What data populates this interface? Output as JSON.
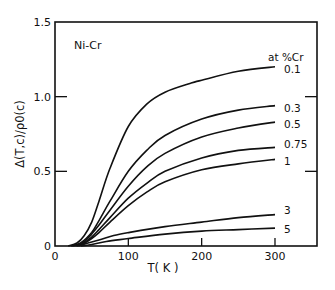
{
  "chart_data": {
    "type": "line",
    "title": "",
    "annotation": "Ni-Cr",
    "legend_title": "at %Cr",
    "xlabel": "T( K )",
    "ylabel": "Δ(T,c)/ρ0(c)",
    "xlim": [
      0,
      360
    ],
    "ylim": [
      0,
      1.5
    ],
    "xticks": [
      0,
      100,
      200,
      300
    ],
    "xtick_labels": [
      "0",
      "100",
      "200",
      "300"
    ],
    "yticks": [
      0,
      0.5,
      1.0,
      1.5
    ],
    "ytick_labels": [
      "0",
      "0.5",
      "1.0",
      "1.5"
    ],
    "grid": false,
    "legend_position": "inline labels at right end of curves",
    "series": [
      {
        "name": "0.1",
        "x": [
          18,
          30,
          40,
          50,
          60,
          75,
          100,
          125,
          150,
          185,
          200,
          250,
          300
        ],
        "y": [
          0,
          0.02,
          0.07,
          0.16,
          0.3,
          0.52,
          0.8,
          0.95,
          1.03,
          1.09,
          1.11,
          1.17,
          1.2
        ]
      },
      {
        "name": "0.3",
        "x": [
          22,
          35,
          50,
          60,
          75,
          100,
          125,
          150,
          200,
          250,
          300
        ],
        "y": [
          0,
          0.02,
          0.09,
          0.17,
          0.3,
          0.5,
          0.64,
          0.74,
          0.85,
          0.91,
          0.94
        ]
      },
      {
        "name": "0.5",
        "x": [
          25,
          40,
          50,
          60,
          75,
          100,
          125,
          150,
          200,
          250,
          300
        ],
        "y": [
          0,
          0.03,
          0.08,
          0.14,
          0.24,
          0.4,
          0.53,
          0.62,
          0.73,
          0.79,
          0.83
        ]
      },
      {
        "name": "0.75",
        "x": [
          28,
          40,
          50,
          60,
          75,
          100,
          125,
          150,
          200,
          250,
          300
        ],
        "y": [
          0,
          0.02,
          0.06,
          0.11,
          0.19,
          0.32,
          0.42,
          0.5,
          0.59,
          0.64,
          0.66
        ]
      },
      {
        "name": "1",
        "x": [
          30,
          40,
          50,
          60,
          75,
          100,
          125,
          150,
          200,
          250,
          300
        ],
        "y": [
          0,
          0.02,
          0.05,
          0.09,
          0.16,
          0.27,
          0.36,
          0.43,
          0.51,
          0.55,
          0.58
        ]
      },
      {
        "name": "3",
        "x": [
          32,
          45,
          60,
          80,
          100,
          150,
          200,
          250,
          300
        ],
        "y": [
          0,
          0.02,
          0.04,
          0.07,
          0.09,
          0.13,
          0.16,
          0.19,
          0.21
        ]
      },
      {
        "name": "5",
        "x": [
          35,
          50,
          70,
          100,
          150,
          200,
          250,
          300
        ],
        "y": [
          0,
          0.01,
          0.03,
          0.05,
          0.08,
          0.1,
          0.11,
          0.12
        ]
      }
    ]
  }
}
